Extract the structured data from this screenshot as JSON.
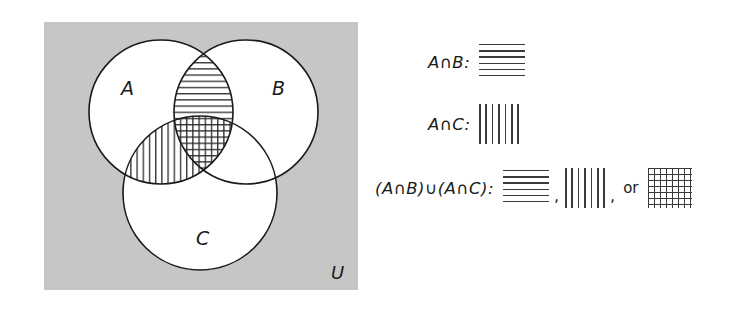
{
  "diagram": {
    "type": "venn-3-set",
    "universe_label": "U",
    "universe_box": {
      "fill_color": "#c6c6c6",
      "x": 44,
      "y": 22,
      "width": 314,
      "height": 268
    },
    "circles": [
      {
        "label": "A",
        "cx": 161,
        "cy": 112,
        "r": 72,
        "label_x": 121,
        "label_y": 95
      },
      {
        "label": "B",
        "cx": 246,
        "cy": 112,
        "r": 72,
        "label_x": 272,
        "label_y": 95
      },
      {
        "label": "C",
        "cx": 200,
        "cy": 193,
        "r": 77,
        "label_x": 196,
        "label_y": 245
      }
    ],
    "shaded_regions": [
      {
        "region": "A∩B only",
        "pattern": "horizontal-lines"
      },
      {
        "region": "A∩C only",
        "pattern": "vertical-lines"
      },
      {
        "region": "A∩B∩C",
        "pattern": "crosshatch"
      }
    ],
    "stroke_color": "#1a1a1a",
    "region_fill": "#ffffff"
  },
  "legend": {
    "rows": [
      {
        "id": "a-int-b",
        "label_parts": {
          "first": "A",
          "operator": "∩",
          "second": "B",
          "colon": ":"
        },
        "label_text": "A∩B:",
        "swatches": [
          "horizontal-lines"
        ]
      },
      {
        "id": "a-int-c",
        "label_parts": {
          "first": "A",
          "operator": "∩",
          "second": "C",
          "colon": ":"
        },
        "label_text": "A∩C:",
        "swatches": [
          "vertical-lines"
        ]
      },
      {
        "id": "union-of-intersections",
        "label_text": "(A∩B)∪(A∩C):",
        "swatches": [
          "horizontal-lines",
          "vertical-lines",
          "crosshatch"
        ],
        "separator": ",",
        "or_word": "or"
      }
    ]
  }
}
